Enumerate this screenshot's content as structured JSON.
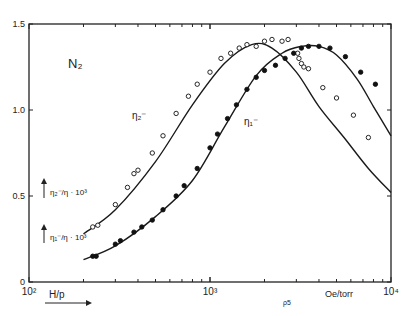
{
  "chart_data": {
    "type": "scatter",
    "gas_label": "N₂",
    "xlabel": "H/p",
    "xunit": "Oe/torr",
    "xscale": "log",
    "xlim": [
      100,
      10000
    ],
    "x_tick_labels": [
      "10²",
      "10³",
      "10⁴"
    ],
    "ylabel_upper": "η₂⁻/η · 10³",
    "ylabel_lower": "η₁⁻/η · 10³",
    "ylim": [
      0,
      1.5
    ],
    "y_tick_labels": [
      "0",
      "0.5",
      "1.0",
      "1.5"
    ],
    "y_ticks": [
      0,
      0.5,
      1.0,
      1.5
    ],
    "grid": false,
    "legend": "none (curves labeled inline)",
    "curve_labels": [
      "η₂⁻",
      "η₁⁻"
    ],
    "stray_mark": "ρ5",
    "series": [
      {
        "name": "η₂⁻ (open circles)",
        "marker": "open-circle",
        "points": [
          {
            "x": 225,
            "y": 0.32
          },
          {
            "x": 240,
            "y": 0.33
          },
          {
            "x": 300,
            "y": 0.45
          },
          {
            "x": 350,
            "y": 0.55
          },
          {
            "x": 380,
            "y": 0.63
          },
          {
            "x": 400,
            "y": 0.65
          },
          {
            "x": 480,
            "y": 0.75
          },
          {
            "x": 550,
            "y": 0.85
          },
          {
            "x": 650,
            "y": 0.98
          },
          {
            "x": 760,
            "y": 1.08
          },
          {
            "x": 850,
            "y": 1.15
          },
          {
            "x": 1000,
            "y": 1.22
          },
          {
            "x": 1150,
            "y": 1.3
          },
          {
            "x": 1300,
            "y": 1.33
          },
          {
            "x": 1450,
            "y": 1.36
          },
          {
            "x": 1600,
            "y": 1.38
          },
          {
            "x": 1800,
            "y": 1.37
          },
          {
            "x": 2000,
            "y": 1.4
          },
          {
            "x": 2200,
            "y": 1.41
          },
          {
            "x": 2500,
            "y": 1.4
          },
          {
            "x": 2700,
            "y": 1.41
          },
          {
            "x": 3050,
            "y": 1.33
          },
          {
            "x": 3100,
            "y": 1.3
          },
          {
            "x": 3200,
            "y": 1.27
          },
          {
            "x": 3300,
            "y": 1.25
          },
          {
            "x": 3500,
            "y": 1.24
          },
          {
            "x": 4200,
            "y": 1.13
          },
          {
            "x": 5000,
            "y": 1.07
          },
          {
            "x": 6200,
            "y": 0.97
          },
          {
            "x": 7500,
            "y": 0.84
          }
        ],
        "fit_curve": {
          "x": [
            200,
            300,
            500,
            800,
            1200,
            1700,
            2200,
            3000,
            4000,
            5500,
            7500,
            10000
          ],
          "y": [
            0.28,
            0.42,
            0.7,
            1.03,
            1.27,
            1.38,
            1.36,
            1.22,
            1.02,
            0.84,
            0.66,
            0.52
          ]
        }
      },
      {
        "name": "η₁⁻ (filled circles)",
        "marker": "filled-circle",
        "points": [
          {
            "x": 225,
            "y": 0.15
          },
          {
            "x": 235,
            "y": 0.15
          },
          {
            "x": 300,
            "y": 0.22
          },
          {
            "x": 320,
            "y": 0.24
          },
          {
            "x": 380,
            "y": 0.29
          },
          {
            "x": 420,
            "y": 0.32
          },
          {
            "x": 480,
            "y": 0.36
          },
          {
            "x": 550,
            "y": 0.42
          },
          {
            "x": 650,
            "y": 0.5
          },
          {
            "x": 720,
            "y": 0.56
          },
          {
            "x": 850,
            "y": 0.66
          },
          {
            "x": 1000,
            "y": 0.78
          },
          {
            "x": 1100,
            "y": 0.86
          },
          {
            "x": 1250,
            "y": 0.95
          },
          {
            "x": 1400,
            "y": 1.03
          },
          {
            "x": 1600,
            "y": 1.12
          },
          {
            "x": 1800,
            "y": 1.19
          },
          {
            "x": 2000,
            "y": 1.23
          },
          {
            "x": 2300,
            "y": 1.26
          },
          {
            "x": 2600,
            "y": 1.3
          },
          {
            "x": 2900,
            "y": 1.33
          },
          {
            "x": 3200,
            "y": 1.36
          },
          {
            "x": 3500,
            "y": 1.37
          },
          {
            "x": 4000,
            "y": 1.37
          },
          {
            "x": 4600,
            "y": 1.36
          },
          {
            "x": 5600,
            "y": 1.31
          },
          {
            "x": 6800,
            "y": 1.22
          },
          {
            "x": 8200,
            "y": 1.15
          }
        ],
        "fit_curve": {
          "x": [
            200,
            300,
            500,
            800,
            1200,
            1800,
            2500,
            3200,
            4000,
            5000,
            6500,
            8000,
            10000
          ],
          "y": [
            0.13,
            0.21,
            0.38,
            0.59,
            0.9,
            1.2,
            1.33,
            1.37,
            1.37,
            1.32,
            1.18,
            1.02,
            0.85
          ]
        }
      }
    ]
  }
}
